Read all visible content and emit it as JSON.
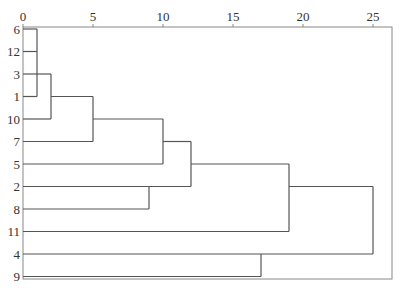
{
  "chart_data": {
    "type": "dendrogram",
    "title": "",
    "xlabel": "",
    "ylabel": "",
    "xlim": [
      0,
      25
    ],
    "x_ticks": [
      0,
      5,
      10,
      15,
      20,
      25
    ],
    "x_tick_labels": [
      "0",
      "5",
      "10",
      "15",
      "20",
      "25"
    ],
    "axis_position": "top",
    "leaf_order": [
      "6",
      "12",
      "3",
      "1",
      "10",
      "7",
      "5",
      "2",
      "8",
      "11",
      "4",
      "9"
    ],
    "merges": [
      {
        "children": [
          "6",
          "12",
          "1"
        ],
        "height": 1,
        "note": "6, 12, 1 join at ~1"
      },
      {
        "children": [
          "[6,12,1]",
          "3"
        ],
        "height": 2
      },
      {
        "children": [
          "[6,12,1,3]",
          "10"
        ],
        "height": 5
      },
      {
        "children": [
          "[...,10]",
          "7"
        ],
        "height": 10
      },
      {
        "children": [
          "[...,7]",
          "5"
        ],
        "height": 12
      },
      {
        "children": [
          "2",
          "8"
        ],
        "height": 9
      },
      {
        "children": [
          "[...,5]",
          "[2,8]"
        ],
        "height": 12
      },
      {
        "children": [
          "[...,2,8]",
          "11"
        ],
        "height": 19
      },
      {
        "children": [
          "4",
          "9"
        ],
        "height": 17
      },
      {
        "children": [
          "[...,11]",
          "[4,9]"
        ],
        "height": 25
      }
    ],
    "segments": [
      {
        "x1": 0,
        "y1": 0,
        "x2": 1,
        "y2": 0
      },
      {
        "x1": 0,
        "y1": 1,
        "x2": 1,
        "y2": 1
      },
      {
        "x1": 0,
        "y1": 3,
        "x2": 1,
        "y2": 3
      },
      {
        "x1": 1,
        "y1": 0,
        "x2": 1,
        "y2": 3
      },
      {
        "x1": 0,
        "y1": 2,
        "x2": 2,
        "y2": 2
      },
      {
        "x1": 2,
        "y1": 2,
        "x2": 2,
        "y2": 4
      },
      {
        "x1": 0,
        "y1": 4,
        "x2": 2,
        "y2": 4
      },
      {
        "x1": 2,
        "y1": 3,
        "x2": 5,
        "y2": 3
      },
      {
        "x1": 5,
        "y1": 3,
        "x2": 5,
        "y2": 5
      },
      {
        "x1": 0,
        "y1": 5,
        "x2": 5,
        "y2": 5
      },
      {
        "x1": 5,
        "y1": 4,
        "x2": 10,
        "y2": 4
      },
      {
        "x1": 10,
        "y1": 4,
        "x2": 10,
        "y2": 6
      },
      {
        "x1": 0,
        "y1": 6,
        "x2": 10,
        "y2": 6
      },
      {
        "x1": 10,
        "y1": 5,
        "x2": 12,
        "y2": 5
      },
      {
        "x1": 12,
        "y1": 5,
        "x2": 12,
        "y2": 7
      },
      {
        "x1": 0,
        "y1": 7,
        "x2": 12,
        "y2": 7
      },
      {
        "x1": 9,
        "y1": 7,
        "x2": 9,
        "y2": 8
      },
      {
        "x1": 0,
        "y1": 8,
        "x2": 9,
        "y2": 8
      },
      {
        "x1": 12,
        "y1": 6,
        "x2": 19,
        "y2": 6
      },
      {
        "x1": 19,
        "y1": 6,
        "x2": 19,
        "y2": 9
      },
      {
        "x1": 0,
        "y1": 9,
        "x2": 19,
        "y2": 9
      },
      {
        "x1": 19,
        "y1": 7,
        "x2": 25,
        "y2": 7
      },
      {
        "x1": 25,
        "y1": 7,
        "x2": 25,
        "y2": 10
      },
      {
        "x1": 0,
        "y1": 10,
        "x2": 25,
        "y2": 10
      },
      {
        "x1": 17,
        "y1": 10,
        "x2": 17,
        "y2": 11
      },
      {
        "x1": 0,
        "y1": 11,
        "x2": 17,
        "y2": 11
      }
    ],
    "grid": false,
    "legend": null
  },
  "layout": {
    "plot_left_px": 23,
    "px_per_unit": 14,
    "first_row_y": 29,
    "row_spacing": 22.5,
    "frame": {
      "left": 23,
      "top": 27,
      "right": 392,
      "bottom": 279
    },
    "line_color": "#555555",
    "frame_color": "#888888",
    "text_color": "#333333"
  }
}
